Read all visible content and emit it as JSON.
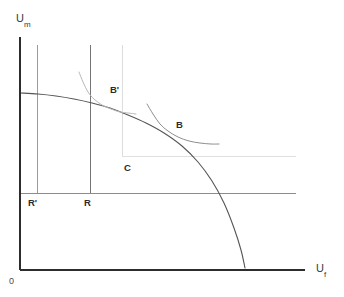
{
  "chart_data": {
    "type": "line",
    "title": "",
    "subtitle": "",
    "xlabel": "U",
    "xlabel_sub": "f",
    "ylabel": "U",
    "ylabel_sub": "m",
    "origin_label": "0",
    "xlim": [
      0,
      1
    ],
    "ylim": [
      0,
      1
    ],
    "grid": false,
    "legend": "none",
    "axes": {
      "x_axis_from": [
        20,
        270
      ],
      "x_axis_to": [
        305,
        270
      ],
      "y_axis_from": [
        20,
        270
      ],
      "y_axis_to": [
        20,
        37
      ]
    },
    "series": [
      {
        "name": "utility-possibility-frontier",
        "role": "frontier",
        "color": "#555555",
        "points": [
          [
            20,
            93
          ],
          [
            38,
            94
          ],
          [
            56,
            96
          ],
          [
            74,
            99
          ],
          [
            92,
            103
          ],
          [
            110,
            108
          ],
          [
            128,
            115
          ],
          [
            146,
            123
          ],
          [
            164,
            133
          ],
          [
            182,
            146
          ],
          [
            198,
            162
          ],
          [
            212,
            181
          ],
          [
            224,
            203
          ],
          [
            234,
            228
          ],
          [
            241,
            250
          ],
          [
            245,
            268
          ]
        ]
      },
      {
        "name": "indifference-curve-B-prime",
        "role": "indifference",
        "color": "#b9b9b9",
        "points": [
          [
            79,
            72
          ],
          [
            83,
            82
          ],
          [
            88,
            92
          ],
          [
            94,
            99
          ],
          [
            102,
            105
          ],
          [
            111,
            109
          ],
          [
            120,
            112
          ],
          [
            128,
            113
          ],
          [
            136,
            114
          ]
        ]
      },
      {
        "name": "indifference-curve-B",
        "role": "indifference",
        "color": "#8e8e8e",
        "points": [
          [
            147,
            104
          ],
          [
            153,
            114
          ],
          [
            160,
            124
          ],
          [
            168,
            131
          ],
          [
            178,
            137
          ],
          [
            189,
            141
          ],
          [
            200,
            143
          ],
          [
            211,
            144
          ],
          [
            219,
            144
          ]
        ]
      }
    ],
    "reference_lines": [
      {
        "name": "r-prime-vertical",
        "orientation": "vertical",
        "color": "#9b9b9b",
        "from": [
          37,
          45
        ],
        "to": [
          37,
          193
        ]
      },
      {
        "name": "r-vertical",
        "orientation": "vertical",
        "color": "#757575",
        "from": [
          90,
          45
        ],
        "to": [
          90,
          193
        ]
      },
      {
        "name": "c-vertical",
        "orientation": "vertical",
        "color": "#dddddd",
        "from": [
          122,
          45
        ],
        "to": [
          122,
          156
        ]
      },
      {
        "name": "c-horizontal",
        "orientation": "horizontal",
        "color": "#e0e0e0",
        "from": [
          122,
          156
        ],
        "to": [
          296,
          156
        ]
      },
      {
        "name": "r-horizontal",
        "orientation": "horizontal",
        "color": "#8c8c8c",
        "from": [
          20,
          193
        ],
        "to": [
          296,
          193
        ]
      }
    ],
    "annotations": [
      {
        "name": "label-b-prime",
        "text": "B'",
        "x": 110,
        "y": 84,
        "bold": true
      },
      {
        "name": "label-b",
        "text": "B",
        "x": 176,
        "y": 119,
        "bold": true
      },
      {
        "name": "label-c",
        "text": "C",
        "x": 124,
        "y": 162,
        "bold": true
      },
      {
        "name": "label-r-prime",
        "text": "R'",
        "x": 28,
        "y": 197,
        "bold": true
      },
      {
        "name": "label-r",
        "text": "R",
        "x": 84,
        "y": 197,
        "bold": true
      }
    ],
    "colors": {
      "axis": "#2d2d2d",
      "frontier": "#555555",
      "indifference_light": "#b9b9b9",
      "indifference_dark": "#8e8e8e",
      "grid_light": "#e0e0e0",
      "grid_mid": "#9b9b9b",
      "background": "#ffffff",
      "text": "#2b2b2b"
    }
  }
}
